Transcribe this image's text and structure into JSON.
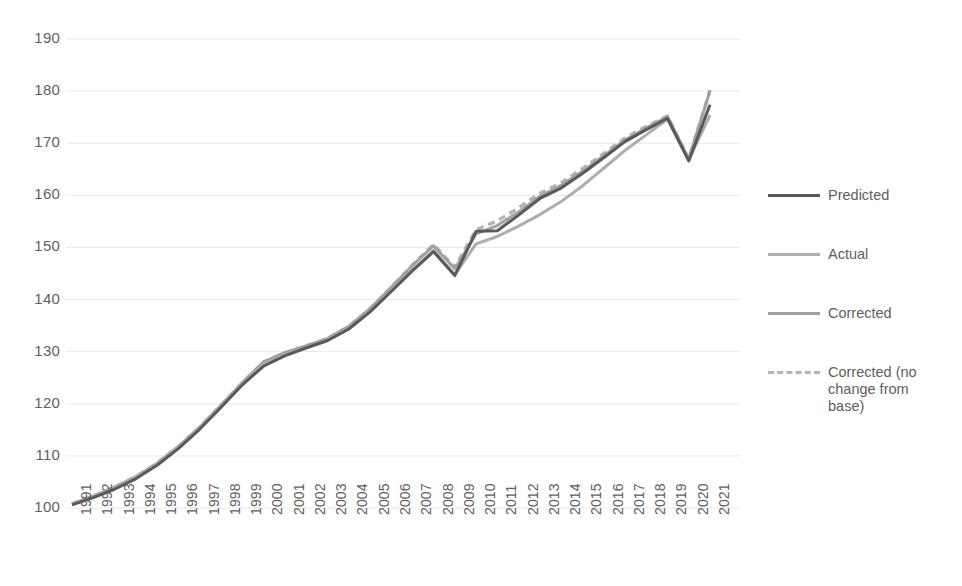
{
  "chart_data": {
    "type": "line",
    "title": "",
    "xlabel": "",
    "ylabel": "",
    "ylim": [
      100,
      190
    ],
    "y_ticks": [
      100,
      110,
      120,
      130,
      140,
      150,
      160,
      170,
      180,
      190
    ],
    "grid": true,
    "legend_position": "right",
    "categories": [
      "1991",
      "1992",
      "1993",
      "1994",
      "1995",
      "1996",
      "1997",
      "1998",
      "1999",
      "2000",
      "2001",
      "2002",
      "2003",
      "2004",
      "2005",
      "2006",
      "2007",
      "2008",
      "2009",
      "2010",
      "2011",
      "2012",
      "2013",
      "2014",
      "2015",
      "2016",
      "2017",
      "2018",
      "2019",
      "2020",
      "2021"
    ],
    "series": [
      {
        "name": "Predicted",
        "color": "#595959",
        "style": "solid",
        "values": [
          100.6,
          102.0,
          103.6,
          105.6,
          108.2,
          111.4,
          115.1,
          119.3,
          123.6,
          127.2,
          129.2,
          130.7,
          132.1,
          134.3,
          137.6,
          141.5,
          145.5,
          149.2,
          144.6,
          153.1,
          153.2,
          156.2,
          159.4,
          161.4,
          164.2,
          167.2,
          170.3,
          172.6,
          174.8,
          166.6,
          177.4
        ]
      },
      {
        "name": "Actual",
        "color": "#aeaeae",
        "style": "solid",
        "values": [
          100.7,
          102.2,
          103.8,
          105.8,
          108.4,
          111.6,
          115.3,
          119.5,
          123.8,
          127.6,
          129.4,
          130.8,
          132.2,
          134.4,
          137.7,
          141.6,
          145.6,
          149.4,
          144.8,
          150.7,
          152.1,
          154.1,
          156.3,
          158.8,
          161.8,
          165.2,
          168.6,
          171.6,
          174.6,
          166.8,
          175.4
        ]
      },
      {
        "name": "Corrected",
        "color": "#a0a0a0",
        "style": "solid",
        "values": [
          100.8,
          102.3,
          104.0,
          106.0,
          108.6,
          111.8,
          115.5,
          119.7,
          124.0,
          128.0,
          129.8,
          131.1,
          132.5,
          134.8,
          138.2,
          142.3,
          146.5,
          150.3,
          145.9,
          152.6,
          154.2,
          156.8,
          159.8,
          161.9,
          164.6,
          167.6,
          170.6,
          172.9,
          175.1,
          167.0,
          180.0
        ]
      },
      {
        "name": "Corrected (no change from base)",
        "color": "#b4b4b4",
        "style": "dashed",
        "values": [
          100.8,
          102.3,
          104.0,
          106.0,
          108.6,
          111.8,
          115.5,
          119.7,
          124.0,
          128.0,
          129.8,
          131.1,
          132.5,
          134.8,
          138.2,
          142.3,
          146.6,
          150.6,
          146.2,
          153.4,
          155.1,
          157.6,
          160.4,
          162.4,
          165.1,
          168.0,
          171.0,
          173.2,
          175.2,
          167.0,
          180.2
        ]
      }
    ]
  },
  "legend": {
    "items": [
      {
        "label": "Predicted"
      },
      {
        "label": "Actual"
      },
      {
        "label": "Corrected"
      },
      {
        "label": "Corrected (no change from base)"
      }
    ]
  },
  "colors": {
    "gridline": "#e8e8e8",
    "tick_text": "#5e5e5e",
    "background": "#ffffff"
  }
}
